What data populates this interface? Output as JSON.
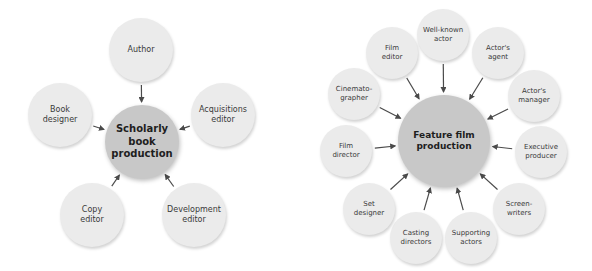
{
  "diagrams": [
    {
      "id": "scholarly",
      "hub": {
        "label": "Scholarly\nbook\nproduction",
        "cx": 142,
        "cy": 142,
        "r": 37
      },
      "colors": {
        "hub": "#c8c8c8",
        "outer": "#ebebeb",
        "arrow": "#4a4a4a"
      },
      "nodes": [
        {
          "label": "Author",
          "cx": 141,
          "cy": 50,
          "r": 32
        },
        {
          "label": "Acquisitions\neditor",
          "cx": 223,
          "cy": 115,
          "r": 32
        },
        {
          "label": "Development\neditor",
          "cx": 194,
          "cy": 215,
          "r": 32
        },
        {
          "label": "Copy\neditor",
          "cx": 92,
          "cy": 215,
          "r": 32
        },
        {
          "label": "Book\ndesigner",
          "cx": 60,
          "cy": 115,
          "r": 32
        }
      ]
    },
    {
      "id": "feature-film",
      "hub": {
        "label": "Feature film\nproduction",
        "cx": 444,
        "cy": 141,
        "r": 46
      },
      "colors": {
        "hub": "#c8c8c8",
        "outer": "#ebebeb",
        "arrow": "#4a4a4a"
      },
      "nodes": [
        {
          "label": "Well-known\nactor",
          "cx": 443,
          "cy": 35,
          "r": 26
        },
        {
          "label": "Actor's\nagent",
          "cx": 498,
          "cy": 53,
          "r": 26
        },
        {
          "label": "Actor's\nmanager",
          "cx": 534,
          "cy": 96,
          "r": 26
        },
        {
          "label": "Executive\nproducer",
          "cx": 541,
          "cy": 152,
          "r": 26
        },
        {
          "label": "Screen-\nwriters",
          "cx": 519,
          "cy": 209,
          "r": 26
        },
        {
          "label": "Supporting\nactors",
          "cx": 471,
          "cy": 238,
          "r": 26
        },
        {
          "label": "Casting\ndirectors",
          "cx": 416,
          "cy": 238,
          "r": 26
        },
        {
          "label": "Set\ndesigner",
          "cx": 369,
          "cy": 209,
          "r": 26
        },
        {
          "label": "Film\ndirector",
          "cx": 346,
          "cy": 151,
          "r": 26
        },
        {
          "label": "Cinemato-\ngrapher",
          "cx": 354,
          "cy": 94,
          "r": 26
        },
        {
          "label": "Film\neditor",
          "cx": 392,
          "cy": 53,
          "r": 26
        }
      ]
    }
  ]
}
